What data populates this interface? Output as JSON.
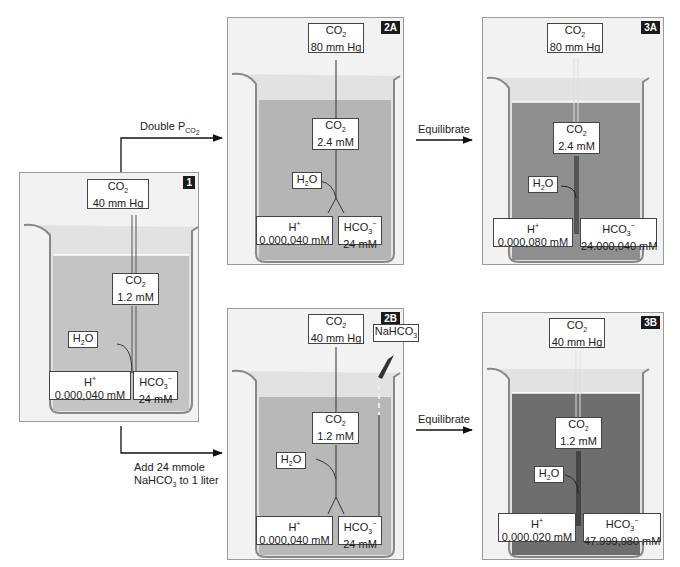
{
  "arrows": {
    "double_pco2": "Double P",
    "double_pco2_sub": "CO",
    "double_pco2_subsub": "2",
    "add_line1": "Add 24 mmole",
    "add_line2a": "NaHCO",
    "add_line2sub": "3",
    "add_line2b": " to 1 liter",
    "equilibrate_top": "Equilibrate",
    "equilibrate_bottom": "Equilibrate"
  },
  "panels": {
    "p1": {
      "tag": "1",
      "co2_gas": "40 mm Hg",
      "co2_dis": "1.2 mM",
      "h2o": "H",
      "h_label": "H",
      "h_val": "0.000,040 mM",
      "hco3_val": "24 mM",
      "fluid": "#c4c4c4"
    },
    "p2a": {
      "tag": "2A",
      "co2_gas": "80 mm Hg",
      "co2_dis": "2.4 mM",
      "h_val": "0.000,040 mM",
      "hco3_val": "24 mM",
      "fluid": "#b5b5b5"
    },
    "p3a": {
      "tag": "3A",
      "co2_gas": "80 mm Hg",
      "co2_dis": "2.4 mM",
      "h_val": "0.000,080 mM",
      "hco3_val": "24.000,040 mM",
      "fluid": "#8f8f8f"
    },
    "p2b": {
      "tag": "2B",
      "co2_gas": "40 mm Hg",
      "co2_dis": "1.2 mM",
      "nahco3": "NaHCO",
      "h_val": "0.000,040 mM",
      "hco3_val": "24 mM",
      "fluid": "#b8b8b8"
    },
    "p3b": {
      "tag": "3B",
      "co2_gas": "40 mm Hg",
      "co2_dis": "1.2 mM",
      "h_val": "0.000,020 mM",
      "hco3_val": "47.999,980 mM",
      "fluid": "#6e6e6e"
    }
  },
  "species": {
    "co2": "CO",
    "two": "2",
    "h2o_h": "H",
    "h2o_o": "O",
    "hplus": "H",
    "plus": "+",
    "hco3": "HCO",
    "three": "3",
    "minus": "−",
    "nahco3_sub": "3"
  }
}
